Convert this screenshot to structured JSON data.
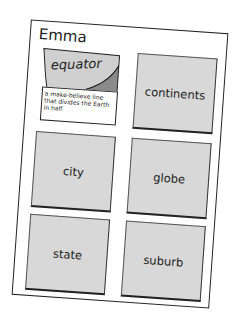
{
  "worksheet": {
    "student_name": "Emma",
    "cards": [
      {
        "word": "equator",
        "flipped": true,
        "definition": "a make-believe line that divides the Earth in half"
      },
      {
        "word": "continents",
        "flipped": false
      },
      {
        "word": "city",
        "flipped": false
      },
      {
        "word": "globe",
        "flipped": false
      },
      {
        "word": "state",
        "flipped": false
      },
      {
        "word": "suburb",
        "flipped": false
      }
    ]
  },
  "colors": {
    "card_fill": "#d8d8d8",
    "card_fold_front": "#cfcfcf",
    "card_fold_back": "#8a8a8a",
    "paper": "#ffffff",
    "ink": "#222222"
  }
}
